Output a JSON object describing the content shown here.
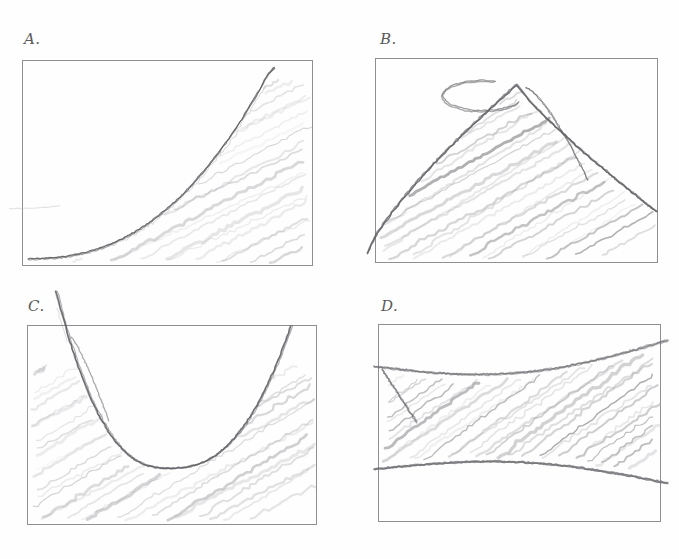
{
  "page": {
    "background_color": "#fefefe",
    "frame_color": "#8f8f93",
    "pencil_color": "#6f6f74",
    "pencil_light_color": "#a9a9ae",
    "label_color": "#5a5a5a",
    "width": 679,
    "height": 559,
    "layout": "2x2 grid of bordered sketch panels"
  },
  "panels": [
    {
      "id": "A",
      "label": "A.",
      "label_x": 24,
      "label_y": 30,
      "frame": {
        "x": 22,
        "y": 60,
        "w": 291,
        "h": 206
      },
      "curve_description": "exponential rising curve from left-middle sweeping up to top-right corner",
      "shading_description": "diagonal pencil hatching filling the region below and right of the curve",
      "curve_type": "exponential-increasing",
      "hatch_direction": "lower-left to upper-right"
    },
    {
      "id": "B",
      "label": "B.",
      "label_x": 380,
      "label_y": 30,
      "frame": {
        "x": 375,
        "y": 58,
        "w": 283,
        "h": 205
      },
      "curve_description": "hill shape rising from bottom-left to a rounded peak near top-center then dropping steeply to the right edge",
      "shading_description": "diagonal pencil hatching filling the area beneath the hill",
      "curve_type": "inverted-u-peak",
      "hatch_direction": "lower-left to upper-right"
    },
    {
      "id": "C",
      "label": "C.",
      "label_x": 28,
      "label_y": 297,
      "frame": {
        "x": 27,
        "y": 325,
        "w": 290,
        "h": 200
      },
      "curve_description": "U-shaped parabola descending from the top-left, flattening at a minimum in the lower middle, then rising to the top-right",
      "shading_description": "diagonal pencil hatching below the U curve",
      "curve_type": "u-shaped-parabola",
      "hatch_direction": "lower-left to upper-right"
    },
    {
      "id": "D",
      "label": "D.",
      "label_x": 381,
      "label_y": 297,
      "frame": {
        "x": 378,
        "y": 324,
        "w": 283,
        "h": 198
      },
      "curve_description": "two gently curved nearly-parallel lines forming a horizontal band across the panel",
      "shading_description": "dense diagonal pencil hatching filling the band between the two lines",
      "curve_type": "parallel-band",
      "hatch_direction": "lower-left to upper-right"
    }
  ]
}
